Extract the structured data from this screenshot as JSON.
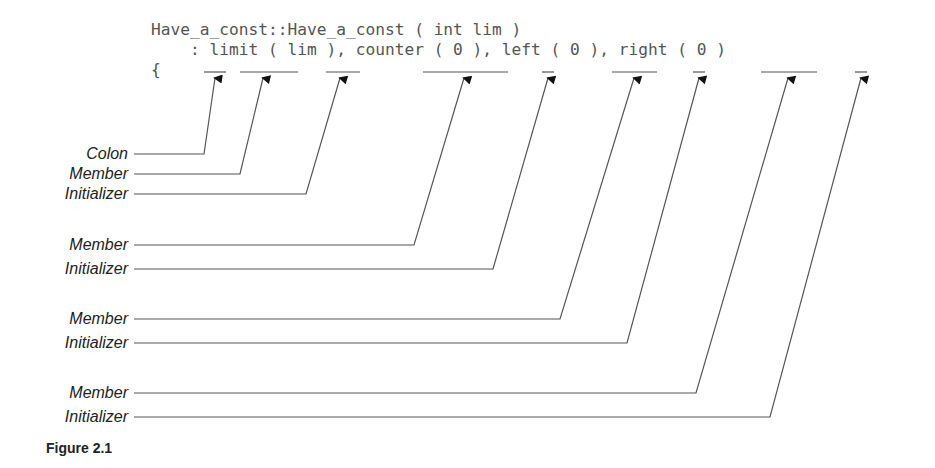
{
  "code": {
    "line1": "Have_a_const::Have_a_const ( int lim )",
    "line2": "    : limit ( lim ), counter ( 0 ), left ( 0 ), right ( 0 )",
    "line3": "{"
  },
  "labels": {
    "colon": "Colon",
    "member1": "Member",
    "initializer1": "Initializer",
    "member2": "Member",
    "initializer2": "Initializer",
    "member3": "Member",
    "initializer3": "Initializer",
    "member4": "Member",
    "initializer4": "Initializer"
  },
  "caption": "Figure 2.1",
  "colors": {
    "code_text": "#555555",
    "lines": "#555555",
    "arrowheads": "#111111"
  }
}
